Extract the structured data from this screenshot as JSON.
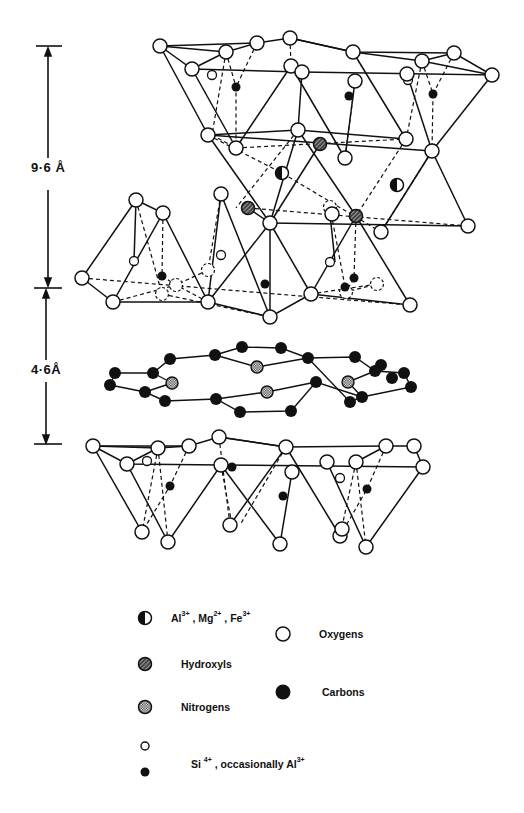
{
  "figure": {
    "dimensions": [
      {
        "id": "d1",
        "label": "9·6 Å",
        "top": 46,
        "bottom": 287
      },
      {
        "id": "d2",
        "label": "4·6Å",
        "top": 287,
        "bottom": 444
      }
    ]
  },
  "atoms": {
    "oxygens": [
      [
        160,
        46
      ],
      [
        257,
        43
      ],
      [
        290,
        38
      ],
      [
        226,
        52
      ],
      [
        192,
        69
      ],
      [
        353,
        52
      ],
      [
        422,
        61
      ],
      [
        454,
        53
      ],
      [
        492,
        75
      ],
      [
        291,
        66
      ],
      [
        302,
        72
      ],
      [
        355,
        81
      ],
      [
        407,
        74
      ],
      [
        208,
        135
      ],
      [
        236,
        148
      ],
      [
        298,
        130
      ],
      [
        345,
        158
      ],
      [
        406,
        139
      ],
      [
        432,
        151
      ],
      [
        136,
        200
      ],
      [
        163,
        213
      ],
      [
        221,
        194
      ],
      [
        270,
        223
      ],
      [
        332,
        214
      ],
      [
        381,
        232
      ],
      [
        468,
        226
      ],
      [
        82,
        278
      ],
      [
        113,
        302
      ],
      [
        208,
        302
      ],
      [
        270,
        317
      ],
      [
        311,
        294
      ],
      [
        410,
        305
      ],
      [
        93,
        446
      ],
      [
        158,
        448
      ],
      [
        127,
        464
      ],
      [
        189,
        446
      ],
      [
        219,
        437
      ],
      [
        286,
        447
      ],
      [
        386,
        446
      ],
      [
        356,
        462
      ],
      [
        414,
        446
      ],
      [
        221,
        465
      ],
      [
        292,
        472
      ],
      [
        327,
        462
      ],
      [
        142,
        532
      ],
      [
        168,
        542
      ],
      [
        230,
        525
      ],
      [
        280,
        544
      ],
      [
        340,
        536
      ],
      [
        366,
        547
      ],
      [
        423,
        467
      ],
      [
        342,
        529
      ]
    ],
    "oxygens_dashed": [
      [
        330,
        207
      ],
      [
        208,
        270
      ],
      [
        176,
        285
      ],
      [
        162,
        294
      ],
      [
        377,
        284
      ],
      [
        346,
        292
      ]
    ],
    "si_open_small": [
      [
        212,
        75
      ],
      [
        408,
        80
      ],
      [
        134,
        261
      ],
      [
        221,
        255
      ],
      [
        330,
        262
      ],
      [
        147,
        461
      ],
      [
        340,
        478
      ]
    ],
    "si_filled": [
      [
        236,
        87
      ],
      [
        349,
        96
      ],
      [
        433,
        94
      ],
      [
        162,
        276
      ],
      [
        265,
        284
      ],
      [
        345,
        287
      ],
      [
        354,
        278
      ],
      [
        170,
        486
      ],
      [
        283,
        496
      ],
      [
        367,
        489
      ],
      [
        232,
        467
      ]
    ],
    "octahedral_cations": [
      [
        282,
        173
      ],
      [
        397,
        185
      ]
    ],
    "hydroxyls": [
      [
        320,
        144
      ],
      [
        248,
        208
      ],
      [
        356,
        216
      ]
    ],
    "carbons": [
      [
        115,
        373
      ],
      [
        110,
        385
      ],
      [
        153,
        373
      ],
      [
        145,
        392
      ],
      [
        170,
        359
      ],
      [
        165,
        401
      ],
      [
        215,
        355
      ],
      [
        216,
        399
      ],
      [
        242,
        347
      ],
      [
        240,
        412
      ],
      [
        281,
        348
      ],
      [
        291,
        411
      ],
      [
        308,
        358
      ],
      [
        316,
        382
      ],
      [
        355,
        357
      ],
      [
        350,
        402
      ],
      [
        375,
        371
      ],
      [
        381,
        365
      ],
      [
        392,
        378
      ],
      [
        404,
        373
      ],
      [
        411,
        387
      ],
      [
        362,
        397
      ]
    ],
    "nitrogens": [
      [
        172,
        383
      ],
      [
        257,
        367
      ],
      [
        267,
        392
      ],
      [
        348,
        382
      ]
    ]
  },
  "legend": {
    "items": [
      {
        "symbol": "half-filled-circle",
        "label": "Al",
        "label_parts": [
          "Al",
          "3+",
          " , Mg",
          "2+",
          " , Fe",
          "3+"
        ]
      },
      {
        "symbol": "open-circle",
        "label": "Oxygens"
      },
      {
        "symbol": "hatched-circle",
        "label": "Hydroxyls"
      },
      {
        "symbol": "filled-circle",
        "label": "Carbons"
      },
      {
        "symbol": "stippled-circle",
        "label": "Nitrogens"
      },
      {
        "symbol": "small-open-and-filled-circle",
        "label_parts": [
          "Si ",
          "4+",
          " , occasionally  Al",
          "3+"
        ]
      }
    ]
  },
  "colors": {
    "ink": "#111111",
    "paper": "#ffffff"
  }
}
